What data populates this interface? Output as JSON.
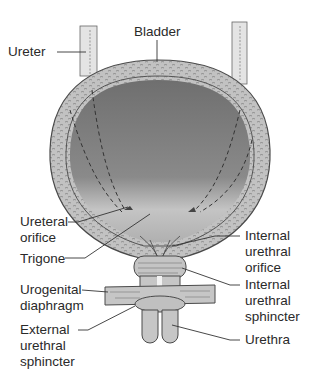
{
  "diagram": {
    "colors": {
      "wall": "#bdbdbd",
      "lumen_dark": "#7a7a7a",
      "lumen_light": "#c8c8c8",
      "outline": "#4a4a4a",
      "label_text": "#2a2a2a"
    },
    "labels": {
      "ureter": "Ureter",
      "bladder": "Bladder",
      "ureteral_orifice": "Ureteral\norifice",
      "trigone": "Trigone",
      "urogenital_diaphragm": "Urogenital\ndiaphragm",
      "external_urethral_sphincter": "External\nurethral\nsphincter",
      "internal_urethral_orifice": "Internal\nurethral\norifice",
      "internal_urethral_sphincter": "Internal\nurethral\nsphincter",
      "urethra": "Urethra"
    }
  }
}
